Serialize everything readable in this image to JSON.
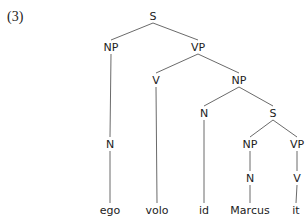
{
  "example_number": "(3)",
  "tree": {
    "nodes": [
      {
        "id": "S1",
        "label": "S",
        "x": 153,
        "y": 16
      },
      {
        "id": "NP1",
        "label": "NP",
        "x": 111,
        "y": 47
      },
      {
        "id": "VP1",
        "label": "VP",
        "x": 198,
        "y": 47
      },
      {
        "id": "V1",
        "label": "V",
        "x": 156,
        "y": 80
      },
      {
        "id": "NP2",
        "label": "NP",
        "x": 239,
        "y": 80
      },
      {
        "id": "N1",
        "label": "N",
        "x": 110,
        "y": 144
      },
      {
        "id": "N2",
        "label": "N",
        "x": 204,
        "y": 113
      },
      {
        "id": "S2",
        "label": "S",
        "x": 273,
        "y": 113
      },
      {
        "id": "NP3",
        "label": "NP",
        "x": 250,
        "y": 144
      },
      {
        "id": "VP2",
        "label": "VP",
        "x": 297,
        "y": 144
      },
      {
        "id": "N3",
        "label": "N",
        "x": 250,
        "y": 178
      },
      {
        "id": "V2",
        "label": "V",
        "x": 297,
        "y": 178
      },
      {
        "id": "w1",
        "label": "ego",
        "x": 110,
        "y": 210
      },
      {
        "id": "w2",
        "label": "volo",
        "x": 157,
        "y": 210
      },
      {
        "id": "w3",
        "label": "id",
        "x": 204,
        "y": 210
      },
      {
        "id": "w4",
        "label": "Marcus",
        "x": 250,
        "y": 210
      },
      {
        "id": "w5",
        "label": "it",
        "x": 296,
        "y": 210
      }
    ],
    "edges": [
      [
        "S1",
        "NP1"
      ],
      [
        "S1",
        "VP1"
      ],
      [
        "VP1",
        "V1"
      ],
      [
        "VP1",
        "NP2"
      ],
      [
        "NP1",
        "N1"
      ],
      [
        "N1",
        "w1"
      ],
      [
        "V1",
        "w2"
      ],
      [
        "NP2",
        "N2"
      ],
      [
        "NP2",
        "S2"
      ],
      [
        "N2",
        "w3"
      ],
      [
        "S2",
        "NP3"
      ],
      [
        "S2",
        "VP2"
      ],
      [
        "NP3",
        "N3"
      ],
      [
        "N3",
        "w4"
      ],
      [
        "VP2",
        "V2"
      ],
      [
        "V2",
        "w5"
      ]
    ]
  }
}
